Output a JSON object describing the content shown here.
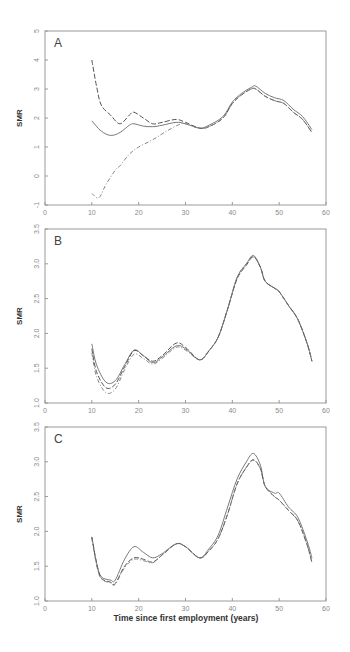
{
  "chart_data": [
    {
      "type": "line",
      "panel": "A",
      "title": "",
      "xlabel": "",
      "ylabel": "SMR",
      "xlim": [
        0,
        60
      ],
      "ylim": [
        -1,
        5
      ],
      "xticks": [
        0,
        10,
        20,
        30,
        40,
        50,
        60
      ],
      "yticks": [
        -1,
        0,
        1,
        2,
        3,
        4,
        5
      ],
      "grid": false,
      "series": [
        {
          "name": "solid",
          "style": "solid",
          "x": [
            10,
            12,
            14,
            16,
            18,
            19,
            21,
            23,
            25,
            28,
            30,
            33,
            35,
            38,
            40,
            42,
            44,
            45,
            47,
            49,
            51,
            53,
            55,
            57
          ],
          "y": [
            1.9,
            1.55,
            1.4,
            1.5,
            1.75,
            1.8,
            1.72,
            1.7,
            1.75,
            1.85,
            1.8,
            1.65,
            1.75,
            2.05,
            2.55,
            2.85,
            3.05,
            3.1,
            2.85,
            2.7,
            2.6,
            2.3,
            2.05,
            1.6
          ]
        },
        {
          "name": "long-dash",
          "style": "dashed",
          "x": [
            10,
            11,
            12,
            14,
            16,
            18,
            19,
            21,
            23,
            25,
            28,
            30,
            33,
            35,
            38,
            40,
            42,
            44,
            45,
            47,
            49,
            51,
            53,
            55,
            57
          ],
          "y": [
            4.0,
            3.1,
            2.45,
            2.1,
            1.8,
            2.1,
            2.2,
            2.0,
            1.8,
            1.85,
            1.95,
            1.85,
            1.65,
            1.7,
            2.0,
            2.5,
            2.8,
            3.0,
            3.0,
            2.75,
            2.6,
            2.5,
            2.2,
            1.95,
            1.5
          ]
        },
        {
          "name": "dash-dot",
          "style": "dashdot",
          "x": [
            10,
            11.5,
            13,
            15,
            16,
            18,
            20,
            23,
            26,
            29,
            30,
            33,
            35,
            38,
            40,
            42,
            44,
            45,
            47,
            49,
            51,
            53,
            55,
            57
          ],
          "y": [
            -0.6,
            -0.75,
            -0.3,
            0.2,
            0.35,
            0.75,
            1.0,
            1.25,
            1.55,
            1.8,
            1.8,
            1.65,
            1.7,
            2.0,
            2.5,
            2.8,
            3.0,
            3.0,
            2.75,
            2.6,
            2.5,
            2.2,
            1.95,
            1.5
          ]
        }
      ]
    },
    {
      "type": "line",
      "panel": "B",
      "title": "",
      "xlabel": "",
      "ylabel": "SMR",
      "xlim": [
        0,
        60
      ],
      "ylim": [
        1.0,
        3.5
      ],
      "xticks": [
        0,
        10,
        20,
        30,
        40,
        50,
        60
      ],
      "yticks": [
        1.0,
        1.5,
        2.0,
        2.5,
        3.0,
        3.5
      ],
      "grid": false,
      "series": [
        {
          "name": "solid",
          "style": "solid",
          "x": [
            10,
            11,
            13,
            15,
            17,
            19,
            21,
            23,
            25,
            28,
            30,
            33,
            35,
            37,
            39,
            41,
            43,
            44.5,
            46,
            47,
            49,
            50,
            52,
            54,
            56,
            57
          ],
          "y": [
            1.85,
            1.55,
            1.3,
            1.32,
            1.55,
            1.76,
            1.68,
            1.58,
            1.66,
            1.82,
            1.78,
            1.62,
            1.75,
            1.95,
            2.35,
            2.8,
            3.0,
            3.12,
            2.95,
            2.75,
            2.65,
            2.6,
            2.4,
            2.2,
            1.85,
            1.6
          ]
        },
        {
          "name": "long-dash",
          "style": "dashed",
          "x": [
            10,
            11,
            13,
            15,
            17,
            19,
            21,
            23,
            25,
            28,
            30,
            33,
            35,
            37,
            39,
            41,
            43,
            44.5,
            46,
            47,
            49,
            50,
            52,
            54,
            56,
            57
          ],
          "y": [
            1.78,
            1.45,
            1.22,
            1.27,
            1.52,
            1.75,
            1.68,
            1.6,
            1.68,
            1.86,
            1.8,
            1.62,
            1.75,
            1.95,
            2.35,
            2.78,
            2.98,
            3.1,
            2.95,
            2.75,
            2.65,
            2.6,
            2.4,
            2.2,
            1.85,
            1.6
          ]
        },
        {
          "name": "dash-dot",
          "style": "dashdot",
          "x": [
            10,
            11,
            13,
            15,
            17,
            19,
            21,
            23,
            25,
            28,
            30,
            33,
            35,
            37,
            39,
            41,
            43,
            44.5,
            46,
            47,
            49,
            50,
            52,
            54,
            56,
            57
          ],
          "y": [
            1.72,
            1.38,
            1.15,
            1.2,
            1.48,
            1.7,
            1.64,
            1.56,
            1.64,
            1.8,
            1.76,
            1.62,
            1.75,
            1.95,
            2.35,
            2.8,
            3.0,
            3.1,
            2.95,
            2.75,
            2.65,
            2.6,
            2.4,
            2.2,
            1.85,
            1.6
          ]
        }
      ]
    },
    {
      "type": "line",
      "panel": "C",
      "title": "",
      "xlabel": "Time since first employment (years)",
      "ylabel": "SMR",
      "xlim": [
        0,
        60
      ],
      "ylim": [
        1.0,
        3.5
      ],
      "xticks": [
        0,
        10,
        20,
        30,
        40,
        50,
        60
      ],
      "yticks": [
        1.0,
        1.5,
        2.0,
        2.5,
        3.0,
        3.5
      ],
      "grid": false,
      "series": [
        {
          "name": "solid",
          "style": "solid",
          "x": [
            10,
            11,
            12,
            14,
            15,
            17,
            19,
            21,
            23,
            25,
            28,
            30,
            33,
            35,
            37,
            39,
            41,
            43,
            44.5,
            46,
            47,
            49,
            50,
            52,
            54,
            56,
            57
          ],
          "y": [
            1.92,
            1.55,
            1.35,
            1.3,
            1.3,
            1.6,
            1.78,
            1.7,
            1.62,
            1.68,
            1.82,
            1.78,
            1.62,
            1.75,
            1.95,
            2.35,
            2.75,
            3.0,
            3.12,
            2.95,
            2.65,
            2.55,
            2.55,
            2.35,
            2.2,
            1.85,
            1.62
          ]
        },
        {
          "name": "long-dash",
          "style": "dashed",
          "x": [
            10,
            11,
            12,
            14,
            15,
            17,
            19,
            21,
            23,
            25,
            28,
            30,
            33,
            35,
            37,
            39,
            41,
            43,
            44.5,
            46,
            47,
            49,
            50,
            52,
            54,
            56,
            57
          ],
          "y": [
            1.92,
            1.55,
            1.33,
            1.27,
            1.25,
            1.5,
            1.62,
            1.6,
            1.56,
            1.66,
            1.82,
            1.78,
            1.62,
            1.72,
            1.9,
            2.25,
            2.68,
            2.92,
            3.03,
            2.9,
            2.65,
            2.5,
            2.45,
            2.3,
            2.15,
            1.8,
            1.55
          ]
        },
        {
          "name": "dash-dot",
          "style": "dashdot",
          "x": [
            10,
            11,
            12,
            14,
            15,
            17,
            19,
            21,
            23,
            25,
            28,
            30,
            33,
            35,
            37,
            39,
            41,
            43,
            44.5,
            46,
            47,
            49,
            50,
            52,
            54,
            56,
            57
          ],
          "y": [
            1.9,
            1.52,
            1.32,
            1.26,
            1.24,
            1.48,
            1.6,
            1.58,
            1.55,
            1.66,
            1.82,
            1.78,
            1.62,
            1.72,
            1.9,
            2.25,
            2.68,
            2.92,
            3.02,
            2.9,
            2.65,
            2.5,
            2.45,
            2.3,
            2.15,
            1.8,
            1.55
          ]
        }
      ]
    }
  ],
  "panels": [
    {
      "label": "A",
      "ylabel": "SMR"
    },
    {
      "label": "B",
      "ylabel": "SMR"
    },
    {
      "label": "C",
      "ylabel": "SMR"
    }
  ],
  "xlabel": "Time since first employment (years)"
}
